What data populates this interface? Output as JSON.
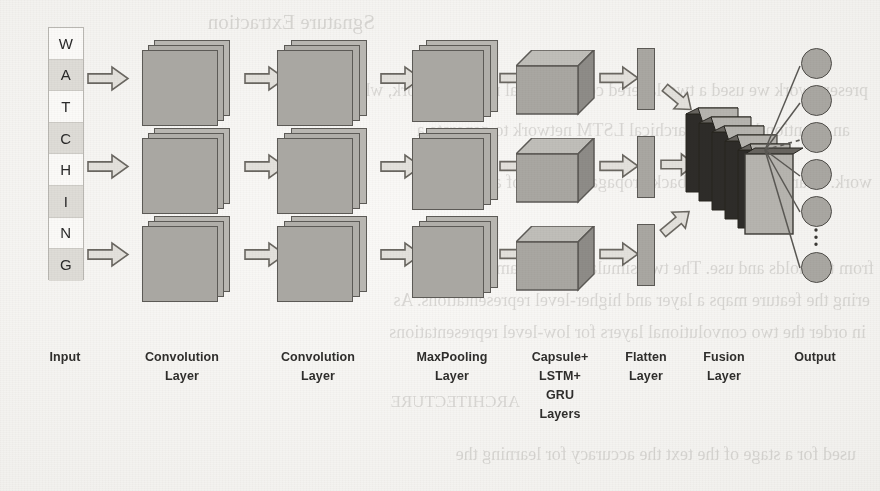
{
  "figure": {
    "input_token": "WATCHING",
    "palette": {
      "paper": "#f4f3f1",
      "block_fill": "#a9a7a2",
      "block_stroke": "#5c5a56",
      "arrow_fill": "#e3e1dc",
      "arrow_stroke": "#6a6761",
      "slab_dark": "#2e2c29",
      "slab_light": "#b6b4af",
      "label_color": "#2f2e2c"
    }
  },
  "input_column": {
    "name": "Input",
    "characters": [
      {
        "char": "W",
        "shade": "white"
      },
      {
        "char": "A",
        "shade": "gray"
      },
      {
        "char": "T",
        "shade": "white"
      },
      {
        "char": "C",
        "shade": "gray"
      },
      {
        "char": "H",
        "shade": "white"
      },
      {
        "char": "I",
        "shade": "gray"
      },
      {
        "char": "N",
        "shade": "white"
      },
      {
        "char": "G",
        "shade": "gray"
      }
    ]
  },
  "labels": [
    {
      "id": "input",
      "lines": [
        "Input"
      ],
      "x": 30,
      "w": 70
    },
    {
      "id": "conv1",
      "lines": [
        "Convolution",
        "Layer"
      ],
      "x": 126,
      "w": 112
    },
    {
      "id": "conv2",
      "lines": [
        "Convolution",
        "Layer"
      ],
      "x": 262,
      "w": 112
    },
    {
      "id": "maxpool",
      "lines": [
        "MaxPooling",
        "Layer"
      ],
      "x": 398,
      "w": 108
    },
    {
      "id": "capsule",
      "lines": [
        "Capsule+",
        "LSTM+",
        "GRU",
        "Layers"
      ],
      "x": 512,
      "w": 96
    },
    {
      "id": "flatten",
      "lines": [
        "Flatten",
        "Layer"
      ],
      "x": 608,
      "w": 76
    },
    {
      "id": "fusion",
      "lines": [
        "Fusion",
        "Layer"
      ],
      "x": 686,
      "w": 76
    },
    {
      "id": "output",
      "lines": [
        "Output"
      ],
      "x": 772,
      "w": 86
    }
  ],
  "layer_labels_flat": {
    "input": "Input",
    "convolution": "Convolution",
    "maxpooling": "MaxPooling",
    "capsule": "Capsule+",
    "lstm": "LSTM+",
    "gru": "GRU",
    "layers": "Layers",
    "layer": "Layer",
    "flatten": "Flatten",
    "fusion": "Fusion",
    "output": "Output"
  },
  "branches": [
    {
      "row": 1,
      "y": 40
    },
    {
      "row": 2,
      "y": 128
    },
    {
      "row": 3,
      "y": 216
    }
  ],
  "output_nodes": [
    {
      "index": 1,
      "y": 48
    },
    {
      "index": 2,
      "y": 85
    },
    {
      "index": 3,
      "y": 122
    },
    {
      "index": 4,
      "y": 159
    },
    {
      "index": 5,
      "y": 196
    },
    {
      "index": 6,
      "y": 252
    }
  ],
  "bleed_text": [
    {
      "text": "Sgnature Extraction",
      "x": 505,
      "y": 10,
      "size": 21
    },
    {
      "text": "present work we used a two-layered convolutional neural network, which",
      "x": 12,
      "y": 80,
      "size": 18
    },
    {
      "text": "an attention-based hierarchical LSTM network to generate a",
      "x": 30,
      "y": 120,
      "size": 18
    },
    {
      "text": "work. Learn- the extracts back propagates result of a sure",
      "x": 8,
      "y": 172,
      "size": 18
    },
    {
      "text": "from the holds and use. The two simulation of a sample of",
      "x": 6,
      "y": 258,
      "size": 18
    },
    {
      "text": "ering the feature maps a layer and higher-level representations. As",
      "x": 10,
      "y": 290,
      "size": 18
    },
    {
      "text": "in order the two convolutional layers for low-level representations",
      "x": 14,
      "y": 322,
      "size": 18
    },
    {
      "text": "ARCHITECTURE",
      "x": 360,
      "y": 392,
      "size": 17
    },
    {
      "text": "used for a stage of the text the accuracy for learning the",
      "x": 24,
      "y": 444,
      "size": 18
    }
  ]
}
